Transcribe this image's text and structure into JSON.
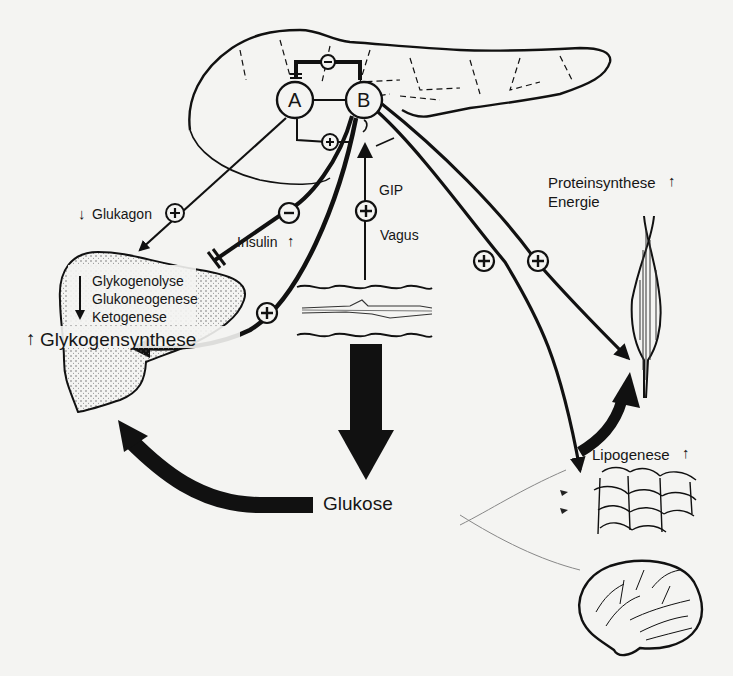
{
  "figure": {
    "background_color": "#f4f4f2",
    "ink_color": "#111111"
  },
  "pancreas": {
    "organ": "Pankreas",
    "cell_a": "A",
    "cell_b": "B",
    "a_to_b_effect": "+",
    "b_to_a_effect": "−"
  },
  "liver": {
    "decreased_processes": [
      "Glykogenolyse",
      "Glukoneogenese",
      "Ketogenese"
    ],
    "increased_process": "Glykogensynthese",
    "increased_arrow": "↑"
  },
  "labels": {
    "glukagon": "Glukagon",
    "glukagon_arrow": "↓",
    "glukagon_effect": "+",
    "insulin": "Insulin",
    "insulin_arrow": "↑",
    "insulin_liver_effect": "−",
    "insulin_liver_plus_effect": "+",
    "gip": "GIP",
    "vagus": "Vagus",
    "gut_effect": "+",
    "glukose": "Glukose",
    "muscle_effect_1": "+",
    "muscle_effect_2": "+",
    "muscle_label_line1": "Proteinsynthese",
    "muscle_label_arrow": "↑",
    "muscle_label_line2": "Energie",
    "fat_label": "Lipogenese",
    "fat_arrow": "↑"
  },
  "organs": [
    "pancreas",
    "liver",
    "intestine",
    "muscle",
    "adipose-tissue",
    "brain"
  ]
}
